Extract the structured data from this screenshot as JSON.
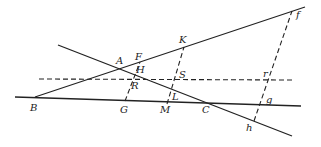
{
  "diagram": {
    "style": {
      "line_color": "#222222",
      "background": "#ffffff"
    },
    "solid_lines": [
      {
        "id": "line-B-A-F-K-f",
        "x1": 35,
        "y1": 97,
        "x2": 305,
        "y2": 7
      },
      {
        "id": "line-A-H-L-C-h",
        "x1": 58,
        "y1": 45,
        "x2": 292,
        "y2": 136
      },
      {
        "id": "line-B-G-M-C-g",
        "x1": 15,
        "y1": 97,
        "x2": 301,
        "y2": 106
      }
    ],
    "dashed_lines": [
      {
        "id": "dashed-horizontal-R-S-r",
        "x1": 39,
        "y1": 79,
        "x2": 295,
        "y2": 80
      },
      {
        "id": "dashed-G-R-H-F",
        "x1": 125,
        "y1": 101,
        "x2": 140,
        "y2": 62
      },
      {
        "id": "dashed-M-L-S-K",
        "x1": 167,
        "y1": 104,
        "x2": 184,
        "y2": 47
      },
      {
        "id": "dashed-h-g-r-f",
        "x1": 254,
        "y1": 121,
        "x2": 292,
        "y2": 11
      }
    ],
    "labels": [
      {
        "text": "f",
        "x": 296,
        "y": 18
      },
      {
        "text": "K",
        "x": 179,
        "y": 43
      },
      {
        "text": "F",
        "x": 135,
        "y": 60
      },
      {
        "text": "A",
        "x": 116,
        "y": 64
      },
      {
        "text": "H",
        "x": 136,
        "y": 73
      },
      {
        "text": "S",
        "x": 179,
        "y": 78
      },
      {
        "text": "r",
        "x": 263,
        "y": 77
      },
      {
        "text": "R",
        "x": 131,
        "y": 89
      },
      {
        "text": "L",
        "x": 172,
        "y": 100
      },
      {
        "text": "B",
        "x": 30,
        "y": 111
      },
      {
        "text": "G",
        "x": 120,
        "y": 113
      },
      {
        "text": "M",
        "x": 160,
        "y": 113
      },
      {
        "text": "C",
        "x": 202,
        "y": 113
      },
      {
        "text": "g",
        "x": 266,
        "y": 103
      },
      {
        "text": "h",
        "x": 246,
        "y": 131
      }
    ]
  }
}
